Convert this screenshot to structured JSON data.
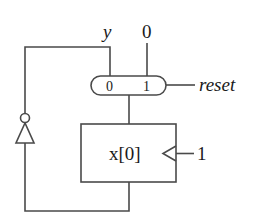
{
  "diagram": {
    "type": "sequential-logic-circuit",
    "labels": {
      "output": "y",
      "mux_input_const": "0",
      "mux_port_0": "0",
      "mux_port_1": "1",
      "select": "reset",
      "register": "x[0]",
      "clock_enable": "1"
    },
    "components": [
      {
        "id": "mux",
        "kind": "multiplexer",
        "inputs": [
          "y",
          "0"
        ],
        "select": "reset"
      },
      {
        "id": "reg",
        "kind": "register",
        "name": "x[0]",
        "clock_input": "1"
      },
      {
        "id": "inv",
        "kind": "inverter"
      }
    ],
    "connections": [
      {
        "from": "inv",
        "to": "mux.port0",
        "net": "y"
      },
      {
        "from": "const-0",
        "to": "mux.port1"
      },
      {
        "from": "reset",
        "to": "mux.select"
      },
      {
        "from": "mux",
        "to": "reg.input"
      },
      {
        "from": "reg.output",
        "to": "inv"
      },
      {
        "from": "const-1",
        "to": "reg.clock"
      }
    ],
    "colors": {
      "line": "#4a4a4a",
      "text": "#1a1a1a",
      "background": "#ffffff"
    }
  }
}
